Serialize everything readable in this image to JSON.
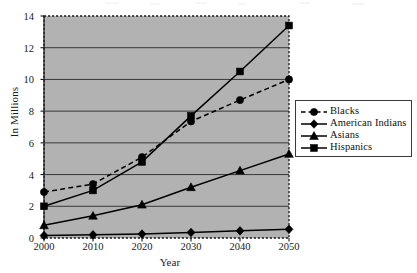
{
  "chart_data": {
    "type": "line",
    "title": "",
    "subtitle": "",
    "xlabel": "Year",
    "ylabel": "In Millions",
    "x": [
      2000,
      2010,
      2020,
      2030,
      2040,
      2050
    ],
    "xticklabels": [
      "2000",
      "2010",
      "2020",
      "2030",
      "2040",
      "2050"
    ],
    "yticklabels": [
      "0",
      "2",
      "4",
      "6",
      "8",
      "10",
      "12",
      "14"
    ],
    "yticks": [
      0,
      2,
      4,
      6,
      8,
      10,
      12,
      14
    ],
    "xlim": [
      2000,
      2050
    ],
    "ylim": [
      0,
      14
    ],
    "grid": "horizontal",
    "legend_position": "right",
    "plot_background": "#b2b2b2",
    "series": [
      {
        "name": "Blacks",
        "marker": "circle",
        "linestyle": "dashed",
        "color": "#000000",
        "values": [
          2.9,
          3.4,
          5.1,
          7.35,
          8.7,
          10.0
        ]
      },
      {
        "name": "American Indians",
        "marker": "diamond",
        "linestyle": "solid",
        "color": "#000000",
        "values": [
          0.15,
          0.2,
          0.25,
          0.35,
          0.45,
          0.55
        ]
      },
      {
        "name": "Asians",
        "marker": "triangle",
        "linestyle": "solid",
        "color": "#000000",
        "values": [
          0.8,
          1.4,
          2.1,
          3.2,
          4.25,
          5.3
        ]
      },
      {
        "name": "Hispanics",
        "marker": "square",
        "linestyle": "solid",
        "color": "#000000",
        "values": [
          2.0,
          3.0,
          4.8,
          7.7,
          10.5,
          13.4
        ]
      }
    ]
  },
  "legend": {
    "entries": [
      "Blacks",
      "American Indians",
      "Asians",
      "Hispanics"
    ]
  }
}
